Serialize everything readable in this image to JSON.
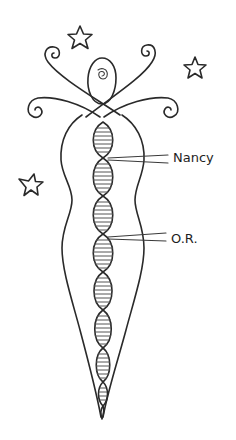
{
  "figure": {
    "labels": [
      {
        "text": "Nancy",
        "x": 173,
        "y": 151
      },
      {
        "text": "O.R.",
        "x": 171,
        "y": 232
      }
    ],
    "stars": [
      {
        "cx": 80,
        "cy": 38,
        "r": 12
      },
      {
        "cx": 195,
        "cy": 68,
        "r": 11
      },
      {
        "cx": 31,
        "cy": 185,
        "r": 12
      }
    ],
    "colors": {
      "ink": "#2a2a2a",
      "background": "#ffffff"
    }
  }
}
